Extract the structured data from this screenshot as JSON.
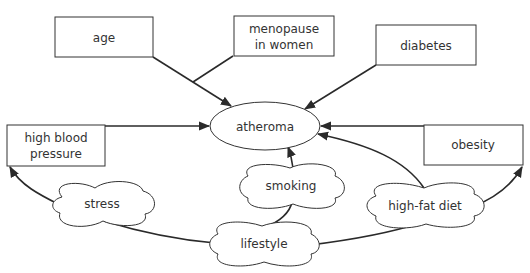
{
  "diagram": {
    "type": "concept-map",
    "center": {
      "id": "atheroma",
      "label": "atheroma",
      "shape": "ellipse"
    },
    "factors": [
      {
        "id": "age",
        "lines": [
          "age"
        ],
        "shape": "box"
      },
      {
        "id": "menopause",
        "lines": [
          "menopause",
          "in women"
        ],
        "shape": "box"
      },
      {
        "id": "diabetes",
        "lines": [
          "diabetes"
        ],
        "shape": "box"
      },
      {
        "id": "high-blood-pressure",
        "lines": [
          "high blood",
          "pressure"
        ],
        "shape": "box"
      },
      {
        "id": "obesity",
        "lines": [
          "obesity"
        ],
        "shape": "box"
      }
    ],
    "lifestyle_nodes": [
      {
        "id": "stress",
        "label": "stress",
        "shape": "cloud"
      },
      {
        "id": "smoking",
        "label": "smoking",
        "shape": "cloud"
      },
      {
        "id": "high-fat-diet",
        "label": "high-fat diet",
        "shape": "cloud"
      },
      {
        "id": "lifestyle",
        "label": "lifestyle",
        "shape": "cloud"
      }
    ],
    "edges": [
      {
        "from": "age",
        "to": "atheroma",
        "arrow": true
      },
      {
        "from": "menopause",
        "to": "atheroma",
        "arrow": false,
        "note": "joins age arrow"
      },
      {
        "from": "diabetes",
        "to": "atheroma",
        "arrow": true
      },
      {
        "from": "high-blood-pressure",
        "to": "atheroma",
        "arrow": true
      },
      {
        "from": "obesity",
        "to": "atheroma",
        "arrow": true
      },
      {
        "from": "high-fat-diet",
        "to": "atheroma",
        "arrow": true
      },
      {
        "from": "smoking",
        "to": "atheroma",
        "arrow": true
      },
      {
        "from": "stress",
        "to": "high-blood-pressure",
        "arrow": true
      },
      {
        "from": "high-fat-diet",
        "to": "obesity",
        "arrow": true
      },
      {
        "from": "lifestyle",
        "to": "stress",
        "arrow": false
      },
      {
        "from": "lifestyle",
        "to": "smoking",
        "arrow": false
      },
      {
        "from": "lifestyle",
        "to": "high-fat-diet",
        "arrow": false
      }
    ]
  }
}
